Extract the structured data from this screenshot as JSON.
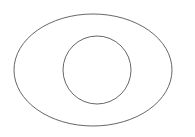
{
  "document": {
    "title": "Annulus Line Drawing",
    "background_color": "#ffffff",
    "width": 195,
    "height": 137
  },
  "figure": {
    "name": "concentric-ellipse-and-circle",
    "shape_count": "2",
    "fill": "none",
    "stroke_color": "#555555",
    "stroke_width": "0.9"
  },
  "shapes": [
    {
      "name": "outer-ellipse",
      "type": "ellipse",
      "cx": 93,
      "cy": 70,
      "rx": 79,
      "ry": 56,
      "stroke": "#555555",
      "stroke_width": 0.9,
      "fill": "none"
    },
    {
      "name": "inner-circle",
      "type": "circle",
      "cx": 97,
      "cy": 70,
      "r": 34,
      "stroke": "#555555",
      "stroke_width": 0.9,
      "fill": "none"
    }
  ]
}
